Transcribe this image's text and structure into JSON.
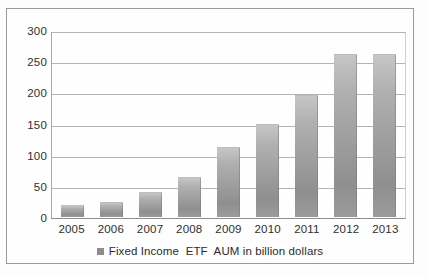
{
  "chart_data": {
    "type": "bar",
    "title": "",
    "xlabel": "",
    "ylabel": "",
    "categories": [
      "2005",
      "2006",
      "2007",
      "2008",
      "2009",
      "2010",
      "2011",
      "2012",
      "2013"
    ],
    "values": [
      17,
      22,
      38,
      62,
      110,
      147,
      194,
      260,
      260
    ],
    "series": [
      {
        "name": "Fixed Income  ETF  AUM in billion dollars",
        "values": [
          17,
          22,
          38,
          62,
          110,
          147,
          194,
          260,
          260
        ]
      }
    ],
    "ylim": [
      0,
      300
    ],
    "yticks": [
      0,
      50,
      100,
      150,
      200,
      250,
      300
    ],
    "ytick_labels": [
      "0",
      "50",
      "100",
      "150",
      "200",
      "250",
      "300"
    ],
    "grid": true,
    "legend": {
      "position": "bottom",
      "entries": [
        {
          "label": "Fixed Income  ETF  AUM in billion dollars",
          "color": "#8d8d8d",
          "marker": "legend-square-icon"
        }
      ]
    },
    "colors": {
      "bar_fill": "#9d9d9d",
      "gridline": "#b4b4b4",
      "axis": "#8f8f8f",
      "text": "#2e2e2e",
      "frame": "#9a9a9a",
      "background": "#fdfdfc"
    }
  }
}
